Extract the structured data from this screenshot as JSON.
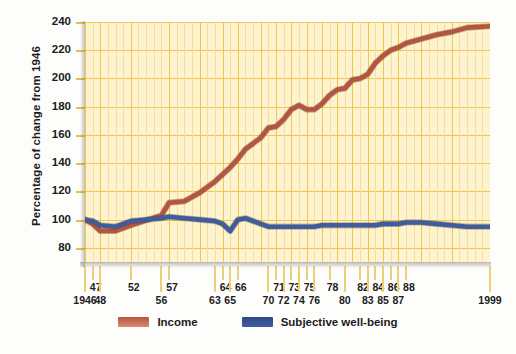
{
  "chart_data": {
    "type": "line",
    "title": "",
    "xlabel": "",
    "ylabel": "Percentage of change from 1946",
    "ylim": [
      70,
      240
    ],
    "yticks": [
      80,
      100,
      120,
      140,
      160,
      180,
      200,
      220,
      240
    ],
    "grid": true,
    "legend_position": "bottom",
    "x_tick_labels_top": [
      "47",
      "52",
      "57",
      "64",
      "66",
      "71",
      "73",
      "75",
      "78",
      "82",
      "84",
      "86",
      "88"
    ],
    "x_tick_labels_bottom": [
      "1946",
      "48",
      "56",
      "63",
      "65",
      "70",
      "72",
      "74",
      "76",
      "80",
      "83",
      "85",
      "87",
      "1999"
    ],
    "x": [
      1946,
      1947,
      1948,
      1950,
      1952,
      1956,
      1957,
      1959,
      1961,
      1963,
      1964,
      1965,
      1966,
      1967,
      1969,
      1970,
      1971,
      1972,
      1973,
      1974,
      1975,
      1976,
      1977,
      1978,
      1979,
      1980,
      1981,
      1982,
      1983,
      1984,
      1985,
      1986,
      1987,
      1988,
      1990,
      1992,
      1994,
      1996,
      1999
    ],
    "series": [
      {
        "name": "Income",
        "color": "#b4553f",
        "values": [
          100,
          97,
          92,
          92,
          96,
          103,
          112,
          113,
          119,
          127,
          132,
          137,
          143,
          150,
          158,
          165,
          166,
          171,
          178,
          181,
          178,
          178,
          182,
          188,
          192,
          193,
          199,
          200,
          203,
          211,
          216,
          220,
          222,
          225,
          228,
          231,
          233,
          236,
          237
        ]
      },
      {
        "name": "Subjective well-being",
        "color": "#3f5c9c",
        "values": [
          100,
          99,
          96,
          95,
          99,
          101,
          102,
          101,
          100,
          99,
          97,
          92,
          100,
          101,
          97,
          95,
          95,
          95,
          95,
          95,
          95,
          95,
          96,
          96,
          96,
          96,
          96,
          96,
          96,
          96,
          97,
          97,
          97,
          98,
          98,
          97,
          96,
          95,
          95
        ]
      }
    ],
    "xlim": [
      1946,
      1999
    ]
  },
  "axis": {
    "ylabel": "Percentage of change from 1946"
  },
  "legend": {
    "items": [
      {
        "label": "Income"
      },
      {
        "label": "Subjective well-being"
      }
    ]
  }
}
